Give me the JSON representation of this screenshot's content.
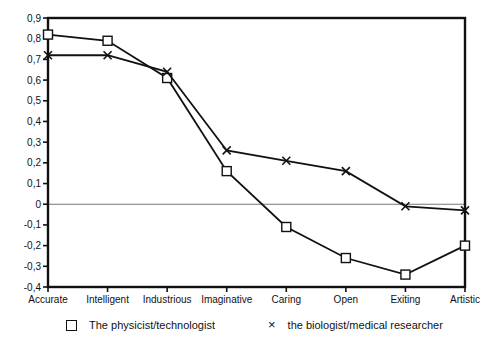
{
  "chart_data": {
    "type": "line",
    "title": "",
    "xlabel": "",
    "ylabel": "",
    "categories": [
      "Accurate",
      "Intelligent",
      "Industrious",
      "Imaginative",
      "Caring",
      "Open",
      "Exiting",
      "Artistic"
    ],
    "series": [
      {
        "name": "The physicist/technologist",
        "marker": "square",
        "values": [
          0.82,
          0.79,
          0.61,
          0.16,
          -0.11,
          -0.26,
          -0.34,
          -0.2
        ]
      },
      {
        "name": "the biologist/medical researcher",
        "marker": "x",
        "values": [
          0.72,
          0.72,
          0.64,
          0.26,
          0.21,
          0.16,
          -0.01,
          -0.03
        ]
      }
    ],
    "ylim": [
      -0.4,
      0.9
    ],
    "ytick_step": 0.1,
    "ytick_labels": [
      "0,9",
      "0,8",
      "0,7",
      "0,6",
      "0,5",
      "0,4",
      "0,3",
      "0,2",
      "0,1",
      "0",
      "-0,1",
      "-0,2",
      "-0,3",
      "-0,4"
    ],
    "grid": false,
    "zero_line": true,
    "frame": "box",
    "legend_position": "bottom",
    "colors": {
      "line": "#111111",
      "axis": "#111111",
      "zero_line": "#777777",
      "background": "#ffffff"
    }
  },
  "legend": {
    "marker_square": "square-marker",
    "marker_x": "×"
  }
}
